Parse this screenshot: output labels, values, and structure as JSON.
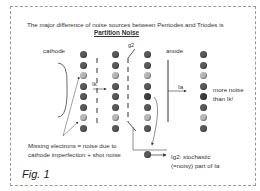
{
  "title": "The major difference of noise sources between Pentodes and Triodes is",
  "subtitle": "Partition Noise",
  "labels": {
    "cathode": "cathode",
    "g2": "g2",
    "anode": "anode",
    "ik": "Ik",
    "ia": "Ia",
    "more_noise_1": "more noise",
    "more_noise_2": "than Ik!",
    "missing_1": "Missing electrons = noise due to",
    "missing_2": "cathode imperfection + shot noise",
    "ig2_1": "Ig2: stochastic",
    "ig2_2": "(=noisy) part of Ia"
  },
  "figure_label": "Fig. 1",
  "columns": [
    {
      "name": "col-cathode",
      "pattern": [
        "n",
        "n",
        "m",
        "n",
        "n",
        "n",
        "m",
        "n"
      ]
    },
    {
      "name": "col-g1",
      "pattern": [
        "n",
        "n",
        "m",
        "n",
        "n",
        "n",
        "m",
        "n"
      ]
    },
    {
      "name": "col-g2",
      "pattern": [
        "n",
        "n",
        "m",
        "n",
        "d",
        "n",
        "m",
        "n"
      ]
    },
    {
      "name": "col-anode",
      "pattern": [
        "n",
        "n",
        "m",
        "n",
        "d",
        "n",
        "m",
        "n"
      ]
    }
  ],
  "colors": {
    "electron": "#5a5a5a",
    "missing": "#b8b8b8",
    "line": "#333333"
  }
}
